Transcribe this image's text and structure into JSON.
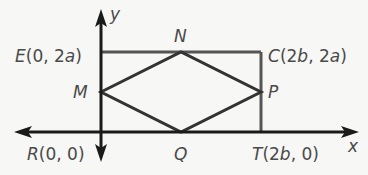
{
  "diagram": {
    "type": "coordinate-geometry",
    "axes": {
      "x_label": "x",
      "y_label": "y"
    },
    "points": [
      {
        "name": "E",
        "coords": "(0, 2a)",
        "px": [
          101,
          52
        ]
      },
      {
        "name": "C",
        "coords": "(2b, 2a)",
        "px": [
          261,
          52
        ]
      },
      {
        "name": "R",
        "coords": "(0, 0)",
        "px": [
          101,
          132
        ]
      },
      {
        "name": "T",
        "coords": "(2b, 0)",
        "px": [
          261,
          132
        ]
      },
      {
        "name": "M",
        "coords": "",
        "px": [
          101,
          92
        ]
      },
      {
        "name": "N",
        "coords": "",
        "px": [
          181,
          52
        ]
      },
      {
        "name": "P",
        "coords": "",
        "px": [
          261,
          92
        ]
      },
      {
        "name": "Q",
        "coords": "",
        "px": [
          181,
          132
        ]
      }
    ],
    "labels": {
      "E": {
        "letter": "E",
        "rest": "(0, 2",
        "var": "a",
        "close": ")"
      },
      "C": {
        "letter": "C",
        "rest": "(2",
        "var1": "b",
        "mid": ", 2",
        "var2": "a",
        "close": ")"
      },
      "R": {
        "letter": "R",
        "rest": "(0, 0)"
      },
      "T": {
        "letter": "T",
        "rest": "(2",
        "var": "b",
        "close": ", 0)"
      },
      "M": "M",
      "N": "N",
      "P": "P",
      "Q": "Q"
    },
    "colors": {
      "background": "#f7f7f5",
      "axis": "#1a1a1a",
      "rectangle": "#555555",
      "rhombus": "#333333",
      "label": "#4a4a4a"
    }
  }
}
